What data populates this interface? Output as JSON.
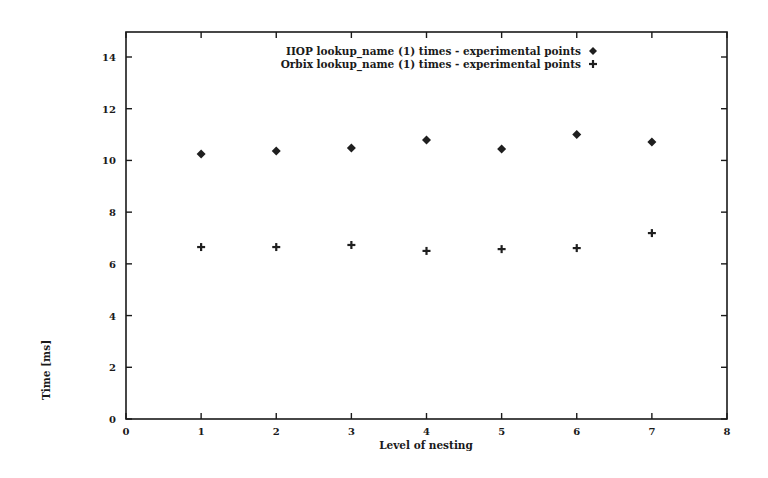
{
  "chart_data": {
    "type": "scatter",
    "title": "",
    "xlabel": "Level of nesting",
    "ylabel": "Time [ms]",
    "xlim": [
      0,
      8
    ],
    "ylim": [
      0,
      15
    ],
    "xticks": [
      0,
      1,
      2,
      3,
      4,
      5,
      6,
      7,
      8
    ],
    "yticks": [
      0,
      2,
      4,
      6,
      8,
      10,
      12,
      14
    ],
    "grid": false,
    "legend_position": "top-inside",
    "x": [
      1,
      2,
      3,
      4,
      5,
      6,
      7
    ],
    "series": [
      {
        "name": "IIOP lookup_name (1) times - experimental points",
        "marker": "diamond",
        "values": [
          10.25,
          10.36,
          10.48,
          10.79,
          10.44,
          11.0,
          10.71
        ]
      },
      {
        "name": "Orbix lookup_name (1) times - experimental points",
        "marker": "plus",
        "values": [
          6.65,
          6.65,
          6.73,
          6.5,
          6.57,
          6.61,
          7.19
        ]
      }
    ]
  },
  "labels": {
    "xlabel": "Level of nesting",
    "ylabel": "Time [ms]",
    "legend_0": "IIOP lookup_name (1) times - experimental points",
    "legend_1": "Orbix lookup_name (1) times - experimental points"
  },
  "colors": {
    "ink": "#1a1a1a",
    "background": "#ffffff"
  }
}
